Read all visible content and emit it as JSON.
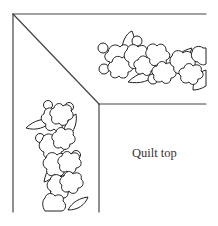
{
  "diagram": {
    "labels": {
      "quilt_top": "Quilt top"
    },
    "colors": {
      "line": "#444444",
      "background": "#ffffff",
      "text": "#333333"
    },
    "parts": [
      "outer border edge",
      "mitered corner seam",
      "inner border edge",
      "floral vine (top border)",
      "floral vine (side border)",
      "quilt top"
    ]
  }
}
